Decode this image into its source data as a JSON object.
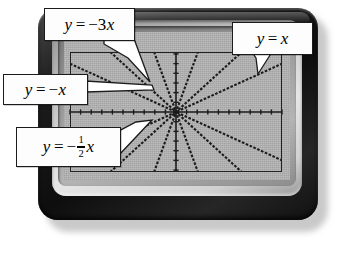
{
  "device": {
    "name": "graphing-calculator",
    "bezel_color": "#141414",
    "frame_color": "#cfcfcf",
    "screen_color": "#b4b4b4",
    "ink_color": "#1b1b1b"
  },
  "callouts": [
    {
      "id": "c1",
      "name": "callout-minus-3x",
      "lhs": "y",
      "equals": "=",
      "sign": "−",
      "coef": "3",
      "var": "x",
      "text": "y = −3x"
    },
    {
      "id": "c2",
      "name": "callout-x",
      "lhs": "y",
      "equals": "=",
      "sign": "",
      "coef": "",
      "var": "x",
      "text": "y = x"
    },
    {
      "id": "c3",
      "name": "callout-minus-x",
      "lhs": "y",
      "equals": "=",
      "sign": "−",
      "coef": "",
      "var": "x",
      "text": "y = −x"
    },
    {
      "id": "c4",
      "name": "callout-minus-half-x",
      "lhs": "y",
      "equals": "=",
      "sign": "−",
      "num": "1",
      "den": "2",
      "var": "x",
      "text": "y = −½x"
    }
  ],
  "chart_data": {
    "type": "line",
    "title": "",
    "xlabel": "",
    "ylabel": "",
    "xlim": [
      -10,
      10
    ],
    "ylim": [
      -6.2,
      6.2
    ],
    "grid": false,
    "axes": {
      "x_axis": true,
      "y_axis": true,
      "tick_spacing_x": 1,
      "tick_spacing_y": 1
    },
    "series": [
      {
        "name": "y = -3x",
        "slope": -3,
        "intercept": 0,
        "label_shown": true,
        "style": "dashed"
      },
      {
        "name": "y = -x",
        "slope": -1,
        "intercept": 0,
        "label_shown": true,
        "style": "dashed"
      },
      {
        "name": "y = -1/2x",
        "slope": -0.5,
        "intercept": 0,
        "label_shown": true,
        "style": "dashed"
      },
      {
        "name": "y = x",
        "slope": 1,
        "intercept": 0,
        "label_shown": true,
        "style": "dashed"
      },
      {
        "name": "y = 3x",
        "slope": 3,
        "intercept": 0,
        "label_shown": false,
        "style": "dashed"
      },
      {
        "name": "y = 1/2x",
        "slope": 0.5,
        "intercept": 0,
        "label_shown": false,
        "style": "dashed"
      }
    ]
  }
}
